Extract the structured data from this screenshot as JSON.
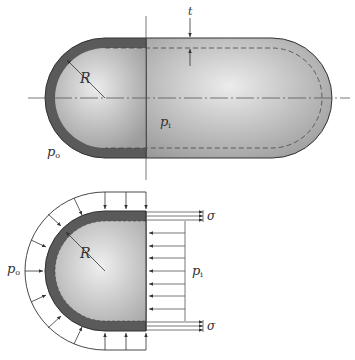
{
  "figure": {
    "top_view": {
      "labels": {
        "thickness": "t",
        "radius": "R",
        "inner_pressure": "p",
        "inner_pressure_sub": "i",
        "outer_pressure": "p",
        "outer_pressure_sub": "o"
      }
    },
    "bottom_view": {
      "labels": {
        "radius": "R",
        "outer_pressure": "p",
        "outer_pressure_sub": "o",
        "inner_pressure": "p",
        "inner_pressure_sub": "i",
        "stress_top": "σ",
        "stress_bottom": "σ"
      }
    },
    "colors": {
      "shell": "#555555",
      "interior_light": "#e8e8e8",
      "interior_dark": "#a8a8a8",
      "line": "#444444"
    }
  }
}
